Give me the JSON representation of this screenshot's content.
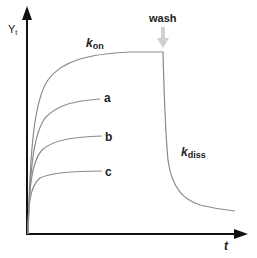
{
  "diagram": {
    "type": "binding-kinetics-sensorgram",
    "y_axis": {
      "label": "Y",
      "subscript": "t"
    },
    "x_axis": {
      "label": "t"
    },
    "annotations": {
      "wash": "wash",
      "kon": {
        "main": "k",
        "sub": "on"
      },
      "kdiss": {
        "main": "k",
        "sub": "diss"
      }
    },
    "curves": [
      {
        "id": "kon",
        "label": ""
      },
      {
        "id": "a",
        "label": "a"
      },
      {
        "id": "b",
        "label": "b"
      },
      {
        "id": "c",
        "label": "c"
      }
    ],
    "colors": {
      "axis": "#111111",
      "curve": "#8a8a8a",
      "wash_arrow": "#d0d0d0",
      "text": "#222222"
    }
  }
}
